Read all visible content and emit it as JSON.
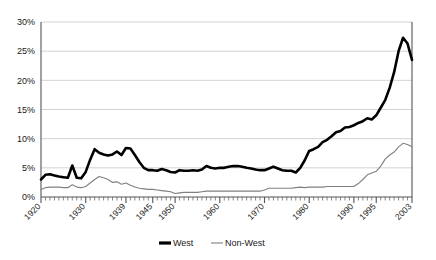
{
  "chart_data": {
    "type": "line",
    "title": "",
    "subtitle": "",
    "xlabel": "",
    "ylabel": "",
    "xlim": [
      1920,
      2003
    ],
    "ylim": [
      0,
      30
    ],
    "ytick_labels": [
      "0%",
      "5%",
      "10%",
      "15%",
      "20%",
      "25%",
      "30%"
    ],
    "ytick_values": [
      0,
      5,
      10,
      15,
      20,
      25,
      30
    ],
    "xtick_labels": [
      "1920",
      "1930",
      "1939",
      "1945",
      "1950",
      "1960",
      "1970",
      "1980",
      "1990",
      "1995",
      "2003"
    ],
    "xtick_values": [
      1920,
      1930,
      1939,
      1945,
      1950,
      1960,
      1970,
      1980,
      1990,
      1995,
      2003
    ],
    "grid": "horizontal",
    "legend_position": "bottom-center",
    "x": [
      1920,
      1921,
      1922,
      1923,
      1924,
      1925,
      1926,
      1927,
      1928,
      1929,
      1930,
      1931,
      1932,
      1933,
      1934,
      1935,
      1936,
      1937,
      1938,
      1939,
      1940,
      1941,
      1942,
      1943,
      1944,
      1945,
      1946,
      1947,
      1948,
      1949,
      1950,
      1951,
      1952,
      1953,
      1954,
      1955,
      1956,
      1957,
      1958,
      1959,
      1960,
      1961,
      1962,
      1963,
      1964,
      1965,
      1966,
      1967,
      1968,
      1969,
      1970,
      1971,
      1972,
      1973,
      1974,
      1975,
      1976,
      1977,
      1978,
      1979,
      1980,
      1981,
      1982,
      1983,
      1984,
      1985,
      1986,
      1987,
      1988,
      1989,
      1990,
      1991,
      1992,
      1993,
      1994,
      1995,
      1996,
      1997,
      1998,
      1999,
      2000,
      2001,
      2002,
      2003
    ],
    "series": [
      {
        "name": "West",
        "color": "#000000",
        "line_width": 2.6,
        "values": [
          3.0,
          3.8,
          3.9,
          3.7,
          3.5,
          3.4,
          3.3,
          5.4,
          3.3,
          3.2,
          4.3,
          6.4,
          8.2,
          7.6,
          7.3,
          7.1,
          7.3,
          7.8,
          7.2,
          8.4,
          8.3,
          7.2,
          6.0,
          5.0,
          4.6,
          4.6,
          4.5,
          4.8,
          4.6,
          4.3,
          4.2,
          4.6,
          4.5,
          4.5,
          4.6,
          4.5,
          4.7,
          5.3,
          5.0,
          4.9,
          5.0,
          5.0,
          5.2,
          5.3,
          5.3,
          5.2,
          5.0,
          4.9,
          4.7,
          4.6,
          4.6,
          4.9,
          5.2,
          4.9,
          4.6,
          4.5,
          4.5,
          4.2,
          5.0,
          6.3,
          7.9,
          8.2,
          8.6,
          9.4,
          9.8,
          10.4,
          11.1,
          11.3,
          11.9,
          12.0,
          12.3,
          12.7,
          13.0,
          13.5,
          13.3,
          14.0,
          15.3,
          16.6,
          18.7,
          21.4,
          25.0,
          27.3,
          26.3,
          23.5
        ]
      },
      {
        "name": "Non-West",
        "color": "#808080",
        "line_width": 1.1,
        "values": [
          1.3,
          1.6,
          1.7,
          1.7,
          1.7,
          1.6,
          1.6,
          2.1,
          1.7,
          1.6,
          1.8,
          2.4,
          3.0,
          3.5,
          3.3,
          3.0,
          2.5,
          2.6,
          2.2,
          2.4,
          2.0,
          1.7,
          1.5,
          1.4,
          1.3,
          1.3,
          1.2,
          1.1,
          1.0,
          0.9,
          0.6,
          0.7,
          0.8,
          0.8,
          0.8,
          0.8,
          0.9,
          1.0,
          1.0,
          1.0,
          1.0,
          1.0,
          1.0,
          1.0,
          1.0,
          1.0,
          1.0,
          1.0,
          1.0,
          1.0,
          1.2,
          1.5,
          1.5,
          1.5,
          1.5,
          1.5,
          1.5,
          1.6,
          1.7,
          1.6,
          1.7,
          1.7,
          1.7,
          1.7,
          1.8,
          1.8,
          1.8,
          1.8,
          1.8,
          1.8,
          1.8,
          2.3,
          3.0,
          3.8,
          4.1,
          4.4,
          5.3,
          6.5,
          7.2,
          7.7,
          8.6,
          9.2,
          9.0,
          8.6
        ]
      }
    ]
  },
  "legend": {
    "items": [
      {
        "label": "West",
        "marker": "thick-line-swatch"
      },
      {
        "label": "Non-West",
        "marker": "thin-line-swatch"
      }
    ]
  },
  "colors": {
    "west": "#000000",
    "non_west": "#808080",
    "grid": "#c8c8c8",
    "axis": "#555555",
    "background": "#ffffff"
  }
}
